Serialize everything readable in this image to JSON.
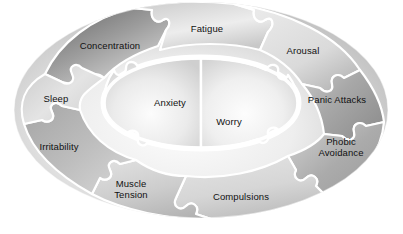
{
  "diagram": {
    "type": "jigsaw-puzzle-ellipse",
    "background_color": "#ffffff",
    "outline_color": "#ffffff",
    "text_color": "#111111",
    "core": {
      "pieces": [
        {
          "id": "anxiety",
          "label": "Anxiety",
          "x": 170,
          "y": 102,
          "tone": "#e8e8e8"
        },
        {
          "id": "worry",
          "label": "Worry",
          "x": 229,
          "y": 121,
          "tone": "#ededed"
        }
      ]
    },
    "outer": {
      "pieces": [
        {
          "id": "concentration",
          "label": "Concentration",
          "x": 110,
          "y": 45,
          "tone": "#8e8e8e"
        },
        {
          "id": "fatigue",
          "label": "Fatigue",
          "x": 207,
          "y": 28,
          "tone": "#d8d8d8"
        },
        {
          "id": "arousal",
          "label": "Arousal",
          "x": 303,
          "y": 50,
          "tone": "#dcdcdc"
        },
        {
          "id": "panic-attacks",
          "label": "Panic Attacks",
          "x": 337,
          "y": 99,
          "tone": "#b0b0b0"
        },
        {
          "id": "phobic-avoidance",
          "label": "Phobic\nAvoidance",
          "x": 341,
          "y": 147,
          "tone": "#b4b4b4"
        },
        {
          "id": "compulsions",
          "label": "Compulsions",
          "x": 241,
          "y": 196,
          "tone": "#d2d2d2"
        },
        {
          "id": "muscle-tension",
          "label": "Muscle\nTension",
          "x": 131,
          "y": 189,
          "tone": "#cfcfcf"
        },
        {
          "id": "irritability",
          "label": "Irritability",
          "x": 59,
          "y": 146,
          "tone": "#bdbdbd"
        },
        {
          "id": "sleep",
          "label": "Sleep",
          "x": 56,
          "y": 98,
          "tone": "#d6d6d6"
        }
      ]
    }
  }
}
